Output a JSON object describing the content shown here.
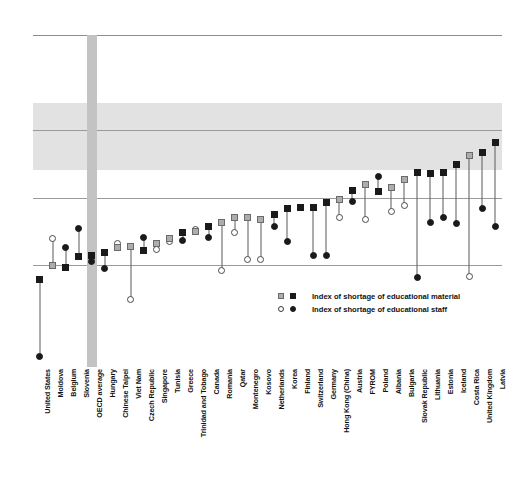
{
  "chart_data": {
    "type": "scatter",
    "title": "",
    "xlabel": "",
    "ylabel": "",
    "ylim": [
      -1.2,
      1.0
    ],
    "grid": true,
    "legend_position": "bottom-right",
    "highlight_category": "OECD average",
    "legend": [
      "Index of shortage of educational material",
      "Index of shortage of educational staff"
    ],
    "series": [
      {
        "name": "Index of shortage of educational material",
        "marker": "square"
      },
      {
        "name": "Index of shortage of educational staff",
        "marker": "circle"
      }
    ],
    "categories": [
      "United States",
      "Moldova",
      "Belgium",
      "Slovenia",
      "OECD average",
      "Hungary",
      "Chinese Taipei",
      "Viet Nam",
      "Czech Republic",
      "Singapore",
      "Tunisia",
      "Greece",
      "Trinidad and Tobago",
      "Canada",
      "Romania",
      "Qatar",
      "Montenegro",
      "Kosovo",
      "Netherlands",
      "Korea",
      "Finland",
      "Switzerland",
      "Germany",
      "Hong Kong (China)",
      "Austria",
      "FYROM",
      "Poland",
      "Albania",
      "Bulgaria",
      "Slovak Republic",
      "Lithuania",
      "Estonia",
      "Iceland",
      "Costa Rica",
      "United Kingdom",
      "Latvia"
    ],
    "oecd_member": [
      true,
      false,
      true,
      true,
      true,
      true,
      false,
      false,
      true,
      false,
      false,
      true,
      false,
      true,
      false,
      false,
      false,
      false,
      true,
      true,
      true,
      true,
      true,
      false,
      true,
      false,
      true,
      false,
      false,
      true,
      true,
      true,
      true,
      false,
      true,
      true
    ],
    "material_values": [
      -0.62,
      -0.53,
      -0.54,
      -0.47,
      -0.46,
      -0.44,
      -0.41,
      -0.4,
      -0.43,
      -0.38,
      -0.35,
      -0.31,
      -0.3,
      -0.27,
      -0.24,
      -0.21,
      -0.21,
      -0.22,
      -0.19,
      -0.15,
      -0.14,
      -0.14,
      -0.11,
      -0.09,
      -0.03,
      0.01,
      -0.04,
      -0.01,
      0.04,
      0.09,
      0.08,
      0.09,
      0.14,
      0.2,
      0.22,
      0.29
    ],
    "staff_values": [
      -1.13,
      -0.35,
      -0.41,
      -0.28,
      -0.5,
      -0.55,
      -0.38,
      -0.75,
      -0.34,
      -0.42,
      -0.37,
      -0.36,
      -0.29,
      -0.34,
      -0.56,
      -0.31,
      -0.49,
      -0.49,
      -0.27,
      -0.37,
      -0.14,
      -0.46,
      -0.46,
      -0.21,
      -0.1,
      -0.22,
      0.06,
      -0.17,
      -0.13,
      -0.61,
      -0.24,
      -0.21,
      -0.25,
      -0.6,
      -0.15,
      -0.27
    ]
  },
  "plot": {
    "gridlines_px": [
      0,
      95,
      163,
      230
    ],
    "band_top_px": 68,
    "band_bottom_px": 135
  },
  "legend_labels": {
    "material": "Index of shortage of educational material",
    "staff": "Index of shortage of educational staff"
  }
}
